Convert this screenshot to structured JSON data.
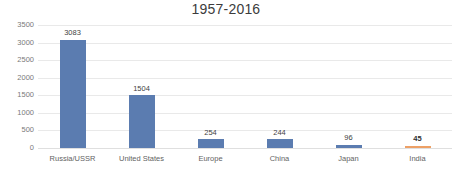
{
  "chart_data": {
    "type": "bar",
    "title": "1957-2016",
    "xlabel": "",
    "ylabel": "",
    "categories": [
      "Russia/USSR",
      "United States",
      "Europe",
      "China",
      "Japan",
      "India"
    ],
    "values": [
      3083,
      1504,
      254,
      244,
      96,
      45
    ],
    "value_labels": [
      "3083",
      "1504",
      "254",
      "244",
      "96",
      "45"
    ],
    "ylim": [
      0,
      3500
    ],
    "y_ticks": [
      0,
      500,
      1000,
      1500,
      2000,
      2500,
      3000,
      3500
    ],
    "y_tick_labels": [
      "0",
      "500",
      "1000",
      "1500",
      "2000",
      "2500",
      "3000",
      "3500"
    ],
    "grid": "horizontal",
    "legend": "none",
    "bar_colors": [
      "#5b7cb0",
      "#5b7cb0",
      "#5b7cb0",
      "#5b7cb0",
      "#5b7cb0",
      "#eda066"
    ],
    "emphasized_category": "India",
    "series": [
      {
        "name": "Launches",
        "values": [
          3083,
          1504,
          254,
          244,
          96,
          45
        ]
      }
    ]
  },
  "colors": {
    "bar": "#5b7cb0",
    "bar_accent": "#eda066",
    "gridline": "#e9e9e9",
    "title_text": "#3c3c3c",
    "axis_text": "#6e6e6e",
    "background": "#ffffff"
  }
}
